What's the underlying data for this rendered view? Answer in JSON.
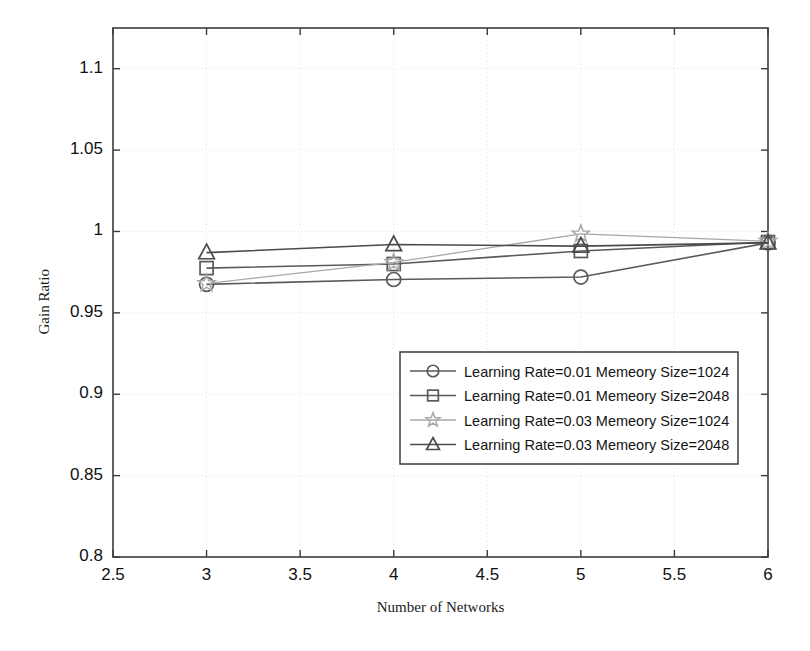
{
  "chart_data": {
    "type": "line",
    "title": "",
    "xlabel": "Number of Networks",
    "ylabel": "Gain Ratio",
    "xlim": [
      2.5,
      6
    ],
    "ylim": [
      0.8,
      1.125
    ],
    "xticks": [
      "2.5",
      "3",
      "3.5",
      "4",
      "4.5",
      "5",
      "5.5",
      "6"
    ],
    "xtick_values": [
      2.5,
      3,
      3.5,
      4,
      4.5,
      5,
      5.5,
      6
    ],
    "yticks": [
      "0.8",
      "0.85",
      "0.9",
      "0.95",
      "1",
      "1.05",
      "1.1"
    ],
    "ytick_values": [
      0.8,
      0.85,
      0.9,
      0.95,
      1.0,
      1.05,
      1.1
    ],
    "grid": true,
    "legend_position": "center-right",
    "x": [
      3,
      4,
      5,
      6
    ],
    "series": [
      {
        "name": "Learning Rate=0.01 Memeory Size=1024",
        "marker": "circle",
        "color": "#595959",
        "values": [
          0.9675,
          0.9705,
          0.972,
          0.993
        ]
      },
      {
        "name": "Learning Rate=0.01 Memeory Size=2048",
        "marker": "square",
        "color": "#595959",
        "values": [
          0.9775,
          0.98,
          0.988,
          0.9935
        ]
      },
      {
        "name": "Learning Rate=0.03 Memeory Size=1024",
        "marker": "star",
        "color": "#a8a8a8",
        "values": [
          0.968,
          0.981,
          0.9985,
          0.994
        ]
      },
      {
        "name": "Learning Rate=0.03 Memeory Size=2048",
        "marker": "triangle",
        "color": "#4a4a4a",
        "values": [
          0.987,
          0.992,
          0.991,
          0.993
        ]
      }
    ]
  },
  "axes": {
    "frame_color": "#3c3c3c",
    "grid_color": "#e3e3e3",
    "background": "#ffffff"
  }
}
